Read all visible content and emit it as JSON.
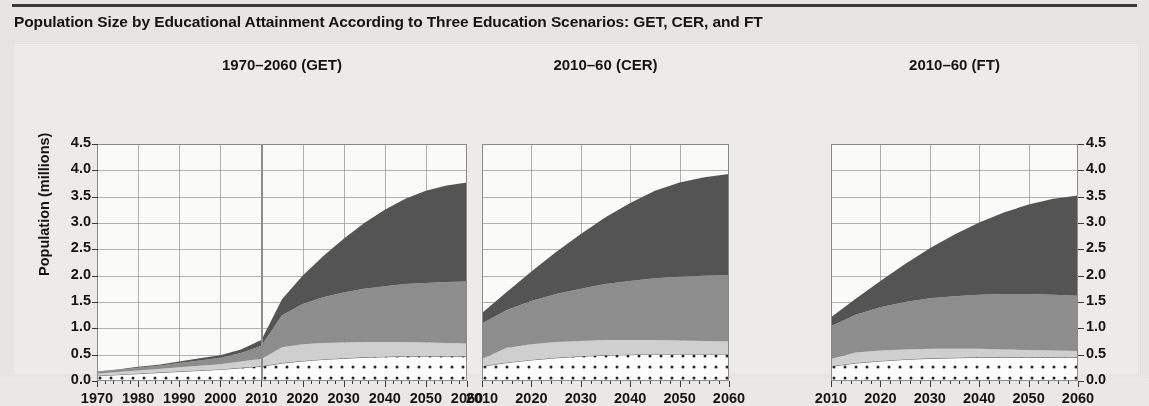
{
  "figure": {
    "title": "Population Size by Educational Attainment According to Three Education Scenarios: GET, CER, and FT",
    "y_axis_title": "Population (millions)",
    "y_ticks": [
      "4.5",
      "4.0",
      "3.5",
      "3.0",
      "2.5",
      "2.0",
      "1.5",
      "1.0",
      "0.5",
      "0.0"
    ],
    "y_ticks_right": [
      "4.5",
      "4.0",
      "3.5",
      "3.0",
      "2.5",
      "2.0",
      "1.5",
      "1.0",
      "0.5",
      "0.0"
    ],
    "ylim": [
      0,
      4.5
    ],
    "background_color": "#efeeec",
    "grid_color": "#9a9a9a",
    "frame_color": "#8c8c8c"
  },
  "panels": [
    {
      "name": "panel-get",
      "title": "1970–2060 (GET)",
      "x_ticks": [
        "1970",
        "1980",
        "1990",
        "2000",
        "2010",
        "2020",
        "2030",
        "2040",
        "2050",
        "2060"
      ],
      "xlim": [
        1970,
        2060
      ],
      "projection_marker_year": 2010
    },
    {
      "name": "panel-cer",
      "title": "2010–60 (CER)",
      "x_ticks": [
        "2010",
        "2020",
        "2030",
        "2040",
        "2050",
        "2060"
      ],
      "xlim": [
        2010,
        2060
      ],
      "projection_marker_year": null
    },
    {
      "name": "panel-ft",
      "title": "2010–60 (FT)",
      "x_ticks": [
        "2010",
        "2020",
        "2030",
        "2040",
        "2050",
        "2060"
      ],
      "xlim": [
        2010,
        2060
      ],
      "projection_marker_year": null
    }
  ],
  "layer_colors": {
    "no_education": "#ffffff",
    "primary": "#d2d2d2",
    "secondary": "#8f8f8f",
    "tertiary": "#555555"
  },
  "chart_data": {
    "type": "area",
    "title": "Population Size by Educational Attainment According to Three Education Scenarios: GET, CER, and FT",
    "xlabel": "",
    "ylabel": "Population (millions)",
    "ylim": [
      0,
      4.5
    ],
    "grid": true,
    "legend": "none",
    "stacked": true,
    "units": "millions",
    "layer_order_bottom_to_top": [
      "No education",
      "Primary",
      "Secondary",
      "Tertiary"
    ],
    "panels": [
      {
        "name": "1970-2060 (GET)",
        "x": [
          1970,
          1975,
          1980,
          1985,
          1990,
          1995,
          2000,
          2005,
          2010,
          2015,
          2020,
          2025,
          2030,
          2035,
          2040,
          2045,
          2050,
          2055,
          2060
        ],
        "series": [
          {
            "name": "No education",
            "values": [
              0.1,
              0.12,
              0.14,
              0.16,
              0.18,
              0.2,
              0.22,
              0.25,
              0.28,
              0.34,
              0.38,
              0.41,
              0.43,
              0.45,
              0.46,
              0.47,
              0.47,
              0.47,
              0.47
            ]
          },
          {
            "name": "Primary",
            "values": [
              0.04,
              0.05,
              0.06,
              0.07,
              0.08,
              0.09,
              0.1,
              0.12,
              0.14,
              0.3,
              0.32,
              0.31,
              0.3,
              0.29,
              0.28,
              0.27,
              0.26,
              0.25,
              0.24
            ]
          },
          {
            "name": "Secondary",
            "values": [
              0.03,
              0.04,
              0.05,
              0.06,
              0.08,
              0.1,
              0.12,
              0.16,
              0.25,
              0.61,
              0.76,
              0.87,
              0.95,
              1.01,
              1.06,
              1.1,
              1.13,
              1.16,
              1.18
            ]
          },
          {
            "name": "Tertiary",
            "values": [
              0.01,
              0.01,
              0.02,
              0.02,
              0.03,
              0.04,
              0.05,
              0.07,
              0.11,
              0.3,
              0.54,
              0.78,
              1.02,
              1.25,
              1.45,
              1.62,
              1.75,
              1.83,
              1.88
            ]
          }
        ],
        "totals": [
          0.18,
          0.22,
          0.27,
          0.31,
          0.37,
          0.43,
          0.49,
          0.6,
          0.78,
          1.55,
          2.0,
          2.37,
          2.7,
          3.0,
          3.25,
          3.46,
          3.61,
          3.71,
          3.77
        ]
      },
      {
        "name": "2010-60 (CER)",
        "x": [
          2010,
          2015,
          2020,
          2025,
          2030,
          2035,
          2040,
          2045,
          2050,
          2055,
          2060
        ],
        "series": [
          {
            "name": "No education",
            "values": [
              0.28,
              0.35,
              0.4,
              0.44,
              0.47,
              0.49,
              0.5,
              0.51,
              0.51,
              0.51,
              0.51
            ]
          },
          {
            "name": "Primary",
            "values": [
              0.14,
              0.28,
              0.3,
              0.3,
              0.29,
              0.29,
              0.28,
              0.27,
              0.26,
              0.25,
              0.24
            ]
          },
          {
            "name": "Secondary",
            "values": [
              0.67,
              0.72,
              0.82,
              0.91,
              0.99,
              1.06,
              1.12,
              1.17,
              1.21,
              1.24,
              1.26
            ]
          },
          {
            "name": "Tertiary",
            "values": [
              0.2,
              0.34,
              0.56,
              0.8,
              1.04,
              1.27,
              1.48,
              1.66,
              1.79,
              1.87,
              1.92
            ]
          }
        ],
        "totals": [
          1.29,
          1.69,
          2.08,
          2.45,
          2.79,
          3.11,
          3.38,
          3.61,
          3.77,
          3.87,
          3.93
        ]
      },
      {
        "name": "2010-60 (FT)",
        "x": [
          2010,
          2015,
          2020,
          2025,
          2030,
          2035,
          2040,
          2045,
          2050,
          2055,
          2060
        ],
        "series": [
          {
            "name": "No education",
            "values": [
              0.28,
              0.34,
              0.38,
              0.41,
              0.43,
              0.44,
              0.45,
              0.45,
              0.45,
              0.45,
              0.45
            ]
          },
          {
            "name": "Primary",
            "values": [
              0.14,
              0.2,
              0.2,
              0.19,
              0.18,
              0.17,
              0.16,
              0.15,
              0.14,
              0.13,
              0.12
            ]
          },
          {
            "name": "Secondary",
            "values": [
              0.62,
              0.72,
              0.82,
              0.9,
              0.96,
              1.0,
              1.03,
              1.05,
              1.06,
              1.06,
              1.05
            ]
          },
          {
            "name": "Tertiary",
            "values": [
              0.17,
              0.3,
              0.5,
              0.72,
              0.95,
              1.17,
              1.37,
              1.55,
              1.7,
              1.82,
              1.9
            ]
          }
        ],
        "totals": [
          1.21,
          1.56,
          1.9,
          2.22,
          2.52,
          2.78,
          3.01,
          3.2,
          3.35,
          3.46,
          3.52
        ]
      }
    ]
  }
}
